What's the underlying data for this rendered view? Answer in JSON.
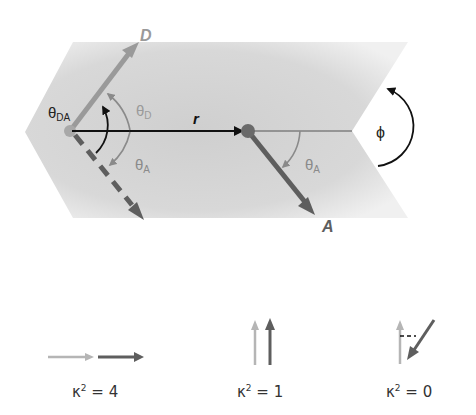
{
  "diagram": {
    "labels": {
      "donor": "D",
      "acceptor": "A",
      "distance": "r",
      "theta_da": "θ",
      "theta_da_sub": "DA",
      "theta_d": "θ",
      "theta_d_sub": "D",
      "theta_a_left": "θ",
      "theta_a_left_sub": "A",
      "theta_a_right": "θ",
      "theta_a_right_sub": "A",
      "phi": "ϕ"
    },
    "colors": {
      "background_band": "#d4d4d4",
      "donor_arrow": "#9a9a9a",
      "acceptor_arrow": "#5e5e5e",
      "distance_arrow": "#111111",
      "angle_arc_gray": "#8a8a8a",
      "angle_arc_black": "#111111"
    }
  },
  "legend": {
    "items": [
      {
        "label": "κ² = 4",
        "kappa": "κ",
        "sup": "2",
        "rest": " = 4",
        "orientation": "collinear"
      },
      {
        "label": "κ² = 1",
        "kappa": "κ",
        "sup": "2",
        "rest": " = 1",
        "orientation": "parallel"
      },
      {
        "label": "κ² = 0",
        "kappa": "κ",
        "sup": "2",
        "rest": " = 0",
        "orientation": "perpendicular"
      }
    ]
  }
}
